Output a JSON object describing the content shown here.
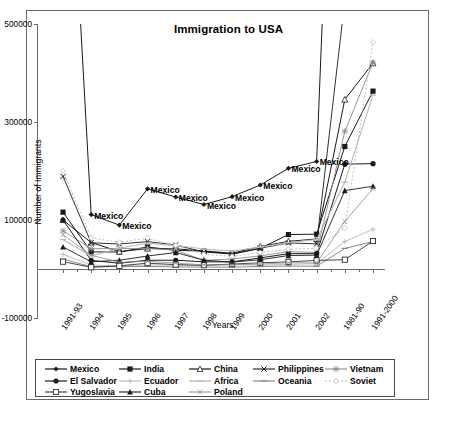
{
  "chart_data": {
    "type": "line",
    "title": "Immigration to USA",
    "xlabel": "Years",
    "ylabel": "Number of Immigrants",
    "ylim": [
      -100000,
      500000
    ],
    "yticks": [
      -100000,
      100000,
      300000,
      500000
    ],
    "ytick_labels": [
      "-100000",
      "100000",
      "300000",
      "500000"
    ],
    "grid": false,
    "legend_position": "bottom",
    "categories": [
      "1991-93",
      "1994",
      "1995",
      "1996",
      "1997",
      "1998",
      "1999",
      "2000",
      "2001",
      "2002",
      "1981-90",
      "1991-2000"
    ],
    "point_labels": {
      "series": "Mexico",
      "text": "Mexico"
    },
    "series": [
      {
        "name": "Mexico",
        "marker": "diamond-filled",
        "values": [
          1150000,
          111000,
          89600,
          163600,
          146900,
          131600,
          147600,
          171400,
          205500,
          219400,
          1653000,
          2249000
        ]
      },
      {
        "name": "India",
        "marker": "square-filled",
        "values": [
          116000,
          34900,
          34700,
          44900,
          38100,
          36500,
          30200,
          42000,
          70300,
          71100,
          250000,
          363000
        ]
      },
      {
        "name": "China",
        "marker": "triangle-open",
        "values": [
          100000,
          54000,
          35500,
          41700,
          41100,
          36900,
          32200,
          45700,
          56400,
          61300,
          346000,
          420000
        ]
      },
      {
        "name": "Philippines",
        "marker": "x-cross",
        "values": [
          189000,
          53500,
          51000,
          55900,
          49100,
          34500,
          31000,
          42500,
          53200,
          51300,
          548000,
          505000
        ]
      },
      {
        "name": "Vietnam",
        "marker": "star",
        "values": [
          78000,
          41300,
          41800,
          42100,
          38500,
          17600,
          20400,
          26700,
          35500,
          33600,
          281000,
          421000
        ]
      },
      {
        "name": "El Salvador",
        "marker": "circle-filled",
        "values": [
          100000,
          17600,
          11700,
          17900,
          17900,
          14600,
          14600,
          22600,
          31300,
          31200,
          214000,
          215000
        ]
      },
      {
        "name": "Ecuador",
        "marker": "plus",
        "values": [
          30000,
          8000,
          6400,
          8300,
          7800,
          6900,
          8800,
          7700,
          9700,
          10600,
          56000,
          81000
        ]
      },
      {
        "name": "Africa",
        "marker": "dash",
        "values": [
          60000,
          26700,
          42500,
          52900,
          47800,
          40700,
          36700,
          44700,
          53900,
          60200,
          177000,
          355000
        ]
      },
      {
        "name": "Oceania",
        "marker": "dash",
        "values": [
          20000,
          4800,
          4800,
          5300,
          4300,
          3900,
          3700,
          5100,
          6100,
          5600,
          42000,
          56000
        ]
      },
      {
        "name": "Soviet",
        "marker": "diamond-open",
        "values": [
          200000,
          63400,
          54500,
          62800,
          48200,
          30100,
          25700,
          33600,
          40200,
          42200,
          84000,
          463000
        ]
      },
      {
        "name": "Yugoslavia",
        "marker": "square-open",
        "values": [
          15000,
          3400,
          6500,
          11900,
          8900,
          7700,
          10000,
          12700,
          14500,
          17500,
          19000,
          57000
        ]
      },
      {
        "name": "Cuba",
        "marker": "triangle-filled",
        "values": [
          45000,
          14700,
          17900,
          26500,
          33600,
          17900,
          14100,
          18900,
          27500,
          28300,
          160000,
          169000
        ]
      },
      {
        "name": "Poland",
        "marker": "x-thin",
        "values": [
          70000,
          28000,
          13800,
          15800,
          12000,
          8500,
          8800,
          10100,
          12900,
          12300,
          97000,
          164000
        ]
      }
    ]
  },
  "legend": {
    "rows": [
      [
        {
          "label": "Mexico",
          "marker": "diamond-filled",
          "style": "solid-dark"
        },
        {
          "label": "India",
          "marker": "square-filled",
          "style": "solid-dark"
        },
        {
          "label": "China",
          "marker": "triangle-open",
          "style": "solid-dark"
        },
        {
          "label": "Philippines",
          "marker": "x-cross",
          "style": "solid-dark"
        },
        {
          "label": "Vietnam",
          "marker": "star",
          "style": "solid-gray"
        }
      ],
      [
        {
          "label": "El Salvador",
          "marker": "circle-filled",
          "style": "solid-dark"
        },
        {
          "label": "Ecuador",
          "marker": "plus",
          "style": "solid-light"
        },
        {
          "label": "Africa",
          "marker": "dash",
          "style": "solid-light"
        },
        {
          "label": "Oceania",
          "marker": "dash",
          "style": "solid-gray"
        },
        {
          "label": "Soviet",
          "marker": "diamond-open",
          "style": "dotted-light"
        }
      ],
      [
        {
          "label": "Yugoslavia",
          "marker": "square-open",
          "style": "solid-dark"
        },
        {
          "label": "Cuba",
          "marker": "triangle-filled",
          "style": "solid-dark"
        },
        {
          "label": "Poland",
          "marker": "x-thin",
          "style": "solid-gray"
        }
      ]
    ]
  },
  "colors": {
    "axis": "#6b6b6b",
    "frame": "#6b6b6b",
    "dark": "#1a1a1a",
    "gray": "#8a8a8a",
    "light": "#b9b9b9",
    "text": "#000000"
  },
  "caption": ""
}
